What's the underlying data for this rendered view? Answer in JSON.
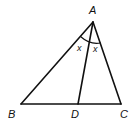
{
  "diagram": {
    "type": "triangle-angle-bisector",
    "points": {
      "A": {
        "label": "A",
        "x": 93,
        "y": 22
      },
      "B": {
        "label": "B",
        "x": 21,
        "y": 104
      },
      "C": {
        "label": "C",
        "x": 121,
        "y": 104
      },
      "D": {
        "label": "D",
        "x": 78,
        "y": 104
      }
    },
    "segments": [
      "AB",
      "AC",
      "BC",
      "AD"
    ],
    "angle_labels": [
      {
        "label": "x",
        "between": "BAD"
      },
      {
        "label": "x",
        "between": "DAC"
      }
    ],
    "colors": {
      "stroke": "#111111",
      "background": "#ffffff"
    }
  }
}
